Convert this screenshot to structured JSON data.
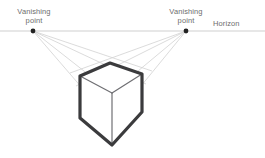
{
  "diagram": {
    "background_color": "#ffffff",
    "labels": {
      "vanishing_point_left": {
        "line1": "Vanishing",
        "line2": "point"
      },
      "vanishing_point_right": {
        "line1": "Vanishing",
        "line2": "point"
      },
      "horizon": "Horizon"
    },
    "colors": {
      "label_text": "#6d6d6d",
      "horizon_line": "#c9c9c9",
      "guide_line": "#d2d2d2",
      "box_outline": "#3b3b3d",
      "box_inner_line": "#6f6f73",
      "vanishing_point_dot": "#222222"
    },
    "geometry": {
      "horizon_y": 31,
      "vanishing_point_left": {
        "x": 33,
        "y": 31
      },
      "vanishing_point_right": {
        "x": 186,
        "y": 31
      },
      "dot_radius": 2.4,
      "box_outline_width": 3.2,
      "box_inner_width": 1.2,
      "box_vertices": {
        "top_apex": {
          "x": 110,
          "y": 63
        },
        "top_left": {
          "x": 80,
          "y": 76
        },
        "top_right": {
          "x": 142,
          "y": 74
        },
        "center_front_top": {
          "x": 112,
          "y": 93
        },
        "bottom_left": {
          "x": 80,
          "y": 118
        },
        "bottom_right": {
          "x": 142,
          "y": 112
        },
        "bottom_apex": {
          "x": 112,
          "y": 145
        }
      }
    }
  }
}
